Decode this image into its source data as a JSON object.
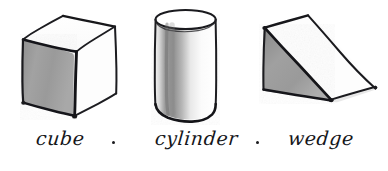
{
  "sheet": {
    "background_color": "#ffffff",
    "ink_color": "#1a1a1d",
    "medium": "hand-drawn pencil and ink sketch"
  },
  "figures": [
    {
      "id": "cube",
      "shape_name": "cube",
      "label": "cube",
      "shaded_face": "left",
      "shade_color": "#9a9a9a",
      "lit_faces": [
        "top",
        "front-right"
      ],
      "lit_color": "#ffffff"
    },
    {
      "id": "cylinder",
      "shape_name": "cylinder",
      "label": "cylinder",
      "shaded_face": "left-curved-band",
      "shade_color": "#9d9d9d",
      "lit_faces": [
        "top-ellipse",
        "right-curved-band"
      ],
      "lit_color": "#ffffff"
    },
    {
      "id": "wedge",
      "shape_name": "wedge",
      "label": "wedge",
      "shaded_face": "left-triangle",
      "shade_color": "#9a9a9a",
      "lit_faces": [
        "inclined-top",
        "right-side"
      ],
      "lit_color": "#ffffff"
    }
  ],
  "caption": {
    "cube_label": "cube",
    "cylinder_label": "cylinder",
    "wedge_label": "wedge",
    "separator": "·",
    "style": "handwritten cursive"
  }
}
